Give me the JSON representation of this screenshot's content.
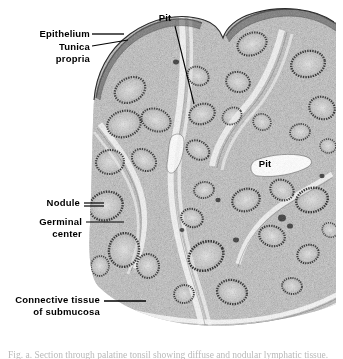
{
  "figure": {
    "kind": "histology-micrograph",
    "background_color": "#ffffff",
    "ink_color": "#000000",
    "tissue_tone": "#9a9a9a"
  },
  "labels": {
    "epithelium": "Epithelium",
    "tunica": "Tunica",
    "propria": "propria",
    "pit_top": "Pit",
    "pit_right": "Pit",
    "nodule": "Nodule",
    "germinal": "Germinal",
    "center": "center",
    "connective_tissue": "Connective  tissue",
    "of_submucosa": "of  submucosa"
  },
  "caption": {
    "text": "Fig.  a.  Section  through  palatine  tonsil  showing  diffuse  and  nodular  lymphatic  tissue."
  }
}
